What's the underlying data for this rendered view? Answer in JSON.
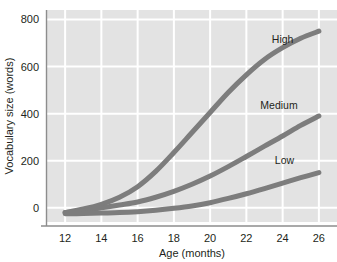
{
  "chart_data": {
    "type": "line",
    "title": "",
    "xlabel": "Age (months)",
    "ylabel": "Vocabulary size (words)",
    "xlim": [
      11,
      27
    ],
    "ylim": [
      -60,
      840
    ],
    "x_ticks": [
      12,
      14,
      16,
      18,
      20,
      22,
      24,
      26
    ],
    "x_tick_labels": [
      "12",
      "14",
      "16",
      "18",
      "20",
      "22",
      "24",
      "26"
    ],
    "y_ticks": [
      0,
      200,
      400,
      600,
      800
    ],
    "y_tick_labels": [
      "0",
      "200",
      "400",
      "600",
      "800"
    ],
    "grid": true,
    "grid_color": "#ffffff",
    "plot_background": "#e3e3e3",
    "line_color": "#7d7d7d",
    "line_width": 5,
    "legend_position": "inline-right",
    "x": [
      12,
      13,
      14,
      15,
      16,
      17,
      18,
      19,
      20,
      21,
      22,
      23,
      24,
      25,
      26
    ],
    "series": [
      {
        "name": "High",
        "label": "High",
        "values": [
          -20,
          -5,
          15,
          45,
          90,
          155,
          235,
          320,
          405,
          490,
          565,
          630,
          680,
          720,
          750
        ]
      },
      {
        "name": "Medium",
        "label": "Medium",
        "values": [
          -20,
          -12,
          0,
          12,
          25,
          45,
          70,
          100,
          135,
          175,
          218,
          262,
          305,
          350,
          390
        ]
      },
      {
        "name": "Low",
        "label": "Low",
        "values": [
          -25,
          -24,
          -22,
          -20,
          -16,
          -10,
          -2,
          8,
          22,
          40,
          60,
          82,
          105,
          128,
          150
        ]
      }
    ],
    "annotations": [
      {
        "text": "High",
        "x": 24.0,
        "y": 700
      },
      {
        "text": "Medium",
        "x": 23.8,
        "y": 420
      },
      {
        "text": "Low",
        "x": 24.1,
        "y": 185
      }
    ]
  }
}
